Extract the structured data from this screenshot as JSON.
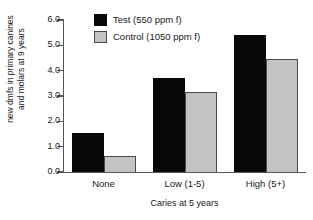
{
  "chart_data": {
    "type": "bar",
    "title": "",
    "xlabel": "Caries at 5 years",
    "ylabel": "new dmfs in primary canines and molars at 9 years",
    "ylabel_lines": [
      "new dmfs in primary canines",
      "and molars at 9 years"
    ],
    "categories": [
      "None",
      "Low (1-5)",
      "High (5+)"
    ],
    "series": [
      {
        "name": "Test (550 ppm f)",
        "color": "#080808",
        "values": [
          1.55,
          3.7,
          5.4
        ]
      },
      {
        "name": "Control (1050 ppm f)",
        "color": "#c3c3c3",
        "values": [
          0.65,
          3.15,
          4.45
        ]
      }
    ],
    "ylim": [
      0,
      6
    ],
    "ytick_labels": [
      "0.0",
      "1.0",
      "2.0",
      "3.0",
      "4.0",
      "5.0",
      "6.0"
    ],
    "ytick_values": [
      0,
      1,
      2,
      3,
      4,
      5,
      6
    ],
    "grid": false,
    "legend_position": "top-center"
  },
  "legend": {
    "items": [
      {
        "label": "Test (550 ppm f)",
        "swatch": "black-square-icon"
      },
      {
        "label": "Control (1050 ppm f)",
        "swatch": "gray-square-icon"
      }
    ]
  }
}
